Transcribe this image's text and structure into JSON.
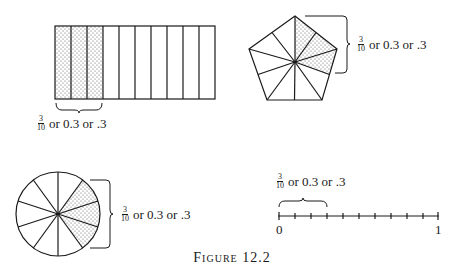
{
  "caption": "Figure 12.2",
  "fraction": {
    "numerator": "3",
    "denominator": "10"
  },
  "equivalents_text": "or 0.3 or .3",
  "models": [
    {
      "id": "rectangle",
      "type": "area-model-strips",
      "parts": 10,
      "shaded": 3
    },
    {
      "id": "pentagon",
      "type": "area-model-pentagon",
      "parts": 10,
      "shaded": 3
    },
    {
      "id": "circle",
      "type": "area-model-circle",
      "parts": 10,
      "shaded": 3
    },
    {
      "id": "number-line",
      "type": "number-line",
      "parts": 10,
      "highlighted": 3
    }
  ],
  "number_line": {
    "start_label": "0",
    "end_label": "1"
  },
  "colors": {
    "ink": "#1a1a1a",
    "shade_dots": "#555555",
    "background": "#ffffff"
  }
}
